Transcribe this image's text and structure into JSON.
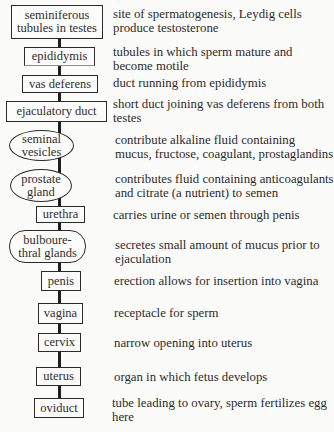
{
  "diagram": {
    "steps": [
      {
        "organ": "seminiferous tubules in testes",
        "organ_lines": [
          "seminiferous",
          "tubules in testes"
        ],
        "shape": "box",
        "description": "site of spermatogenesis, Leydig cells produce testosterone"
      },
      {
        "organ": "epididymis",
        "shape": "box",
        "accent_color": "#e07a2a",
        "description": "tubules in which  sperm mature and become motile"
      },
      {
        "organ": "vas deferens",
        "shape": "box",
        "description": "duct running from epididymis"
      },
      {
        "organ": "ejaculatory duct",
        "shape": "box",
        "description": "short duct joining vas deferens from both testes"
      },
      {
        "organ": "seminal vesicles",
        "organ_lines": [
          "seminal",
          "vesicles"
        ],
        "shape": "oval",
        "description": "contribute alkaline fluid containing mucus, fructose, coagulant, prostaglandins"
      },
      {
        "organ": "prostate gland",
        "organ_lines": [
          "prostate",
          "gland"
        ],
        "shape": "oval",
        "description": "contributes fluid containing anticoagulants and citrate (a nutrient) to semen"
      },
      {
        "organ": "urethra",
        "shape": "box",
        "description": "carries urine or semen through penis"
      },
      {
        "organ": "bulbourethral glands",
        "organ_lines": [
          "bulboure-",
          "thral glands"
        ],
        "shape": "oval",
        "description": "secretes small amount of mucus prior to ejaculation"
      },
      {
        "organ": "penis",
        "shape": "box",
        "description": "erection allows for insertion into vagina"
      },
      {
        "organ": "vagina",
        "shape": "box",
        "description": "receptacle for sperm"
      },
      {
        "organ": "cervix",
        "shape": "box",
        "description": "narrow opening into uterus"
      },
      {
        "organ": "uterus",
        "shape": "box",
        "description": "organ in which fetus develops"
      },
      {
        "organ": "oviduct",
        "shape": "box",
        "description": "tube leading to ovary, sperm fertilizes egg here"
      }
    ]
  }
}
